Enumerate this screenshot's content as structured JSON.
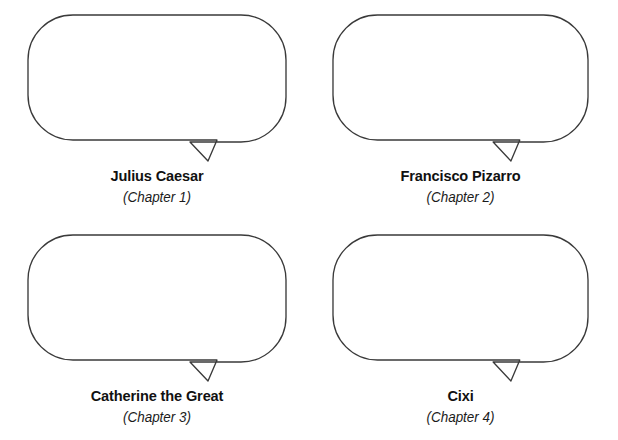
{
  "page": {
    "background_color": "#ffffff",
    "stroke_color": "#3a3a3a",
    "text_color": "#111111",
    "columns": 2,
    "rows": 2
  },
  "bubbles": [
    {
      "index": 1,
      "name": "Julius Caesar",
      "chapter": "(Chapter 1)",
      "bubble_content": "",
      "icon": "speech-bubble-icon"
    },
    {
      "index": 2,
      "name": "Francisco Pizarro",
      "chapter": "(Chapter 2)",
      "bubble_content": "",
      "icon": "speech-bubble-icon"
    },
    {
      "index": 3,
      "name": "Catherine the Great",
      "chapter": "(Chapter 3)",
      "bubble_content": "",
      "icon": "speech-bubble-icon"
    },
    {
      "index": 4,
      "name": "Cixi",
      "chapter": "(Chapter 4)",
      "bubble_content": "",
      "icon": "speech-bubble-icon"
    }
  ]
}
